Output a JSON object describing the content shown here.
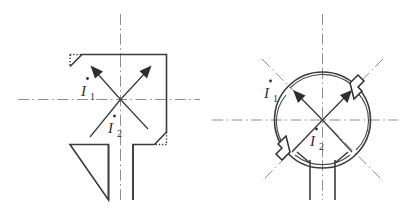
{
  "figure": {
    "background_color": "#ffffff",
    "line_color": "#3b3b3b",
    "centerline_color": "#8e8e8e",
    "panels": [
      {
        "id": "left-panel",
        "name": "square-cross-section",
        "shape": "square-with-chamfered-corners",
        "chamfers": [
          "top-left",
          "bottom-right"
        ],
        "chamfer_style": "dotted",
        "has_stem": true,
        "stem_position": "bottom",
        "centerlines": [
          "horizontal",
          "vertical"
        ],
        "vectors": [
          {
            "label": "I",
            "subscript": "1",
            "overdot": "˙",
            "direction": "upper-left",
            "angle_deg": 135
          },
          {
            "label": "I",
            "subscript": "2",
            "overdot": "˙",
            "direction": "upper-right",
            "angle_deg": 45
          }
        ],
        "labels": [
          {
            "name": "current-label-i1",
            "symbol": "I",
            "subscript": "1",
            "dot": "·"
          },
          {
            "name": "current-label-i2",
            "symbol": "I",
            "subscript": "2",
            "dot": "·"
          }
        ]
      },
      {
        "id": "right-panel",
        "name": "circular-cross-section",
        "shape": "circle-with-inner-arc",
        "notches": [
          "upper-right",
          "lower-left"
        ],
        "notch_style": "rectangular-tab",
        "has_stem": true,
        "stem_position": "bottom",
        "centerlines": [
          "horizontal",
          "vertical",
          "diagonal-45",
          "diagonal-135"
        ],
        "vectors": [
          {
            "label": "I",
            "subscript": "1",
            "overdot": "˙",
            "direction": "upper-left",
            "angle_deg": 135
          },
          {
            "label": "I",
            "subscript": "2",
            "overdot": "˙",
            "direction": "upper-right",
            "angle_deg": 45
          }
        ],
        "labels": [
          {
            "name": "current-label-i1",
            "symbol": "I",
            "subscript": "1",
            "dot": "·"
          },
          {
            "name": "current-label-i2",
            "symbol": "I",
            "subscript": "2",
            "dot": "·"
          }
        ]
      }
    ],
    "symbols": {
      "current_symbol": "I",
      "subscript_one": "1",
      "subscript_two": "2",
      "phasor_dot": "·"
    }
  }
}
